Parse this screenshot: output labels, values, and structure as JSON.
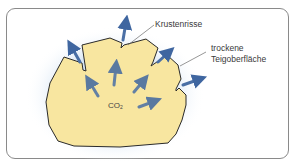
{
  "diagram": {
    "labels": {
      "crust_cracks": "Krustenrisse",
      "dry_surface_line1": "trockene",
      "dry_surface_line2": "Teigoberfläche",
      "gas_main": "CO",
      "gas_sub": "2"
    },
    "colors": {
      "dough_fill": "#f8e6a0",
      "dough_outline": "#2a2a2a",
      "arrow": "#4a6fa5",
      "glow": "#cfe0f2",
      "frame_border": "#8a8a8a",
      "leader_line": "#6a6a6a"
    },
    "arrows_count": 10
  }
}
